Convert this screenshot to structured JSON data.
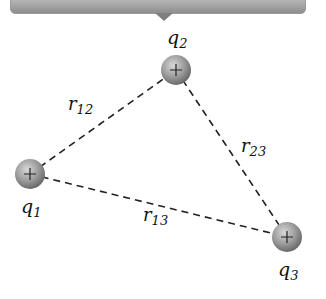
{
  "banner": {
    "color_top": "#c4c4c4",
    "color_bottom": "#8e8e8e"
  },
  "diagram": {
    "charges": [
      {
        "id": "q1",
        "label": "q",
        "subscript": "1",
        "sign": "+",
        "x": 30,
        "y": 174
      },
      {
        "id": "q2",
        "label": "q",
        "subscript": "2",
        "sign": "+",
        "x": 176,
        "y": 70
      },
      {
        "id": "q3",
        "label": "q",
        "subscript": "3",
        "sign": "+",
        "x": 287,
        "y": 237
      }
    ],
    "distances": [
      {
        "id": "r12",
        "label": "r",
        "subscript": "12",
        "from": "q1",
        "to": "q2"
      },
      {
        "id": "r23",
        "label": "r",
        "subscript": "23",
        "from": "q2",
        "to": "q3"
      },
      {
        "id": "r13",
        "label": "r",
        "subscript": "13",
        "from": "q1",
        "to": "q3"
      }
    ]
  }
}
